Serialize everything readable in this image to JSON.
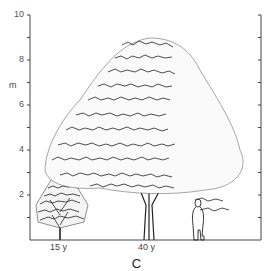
{
  "figure": {
    "y_axis": {
      "unit_label": "m",
      "ticks": [
        {
          "label": "2",
          "value": 2
        },
        {
          "label": "4",
          "value": 4
        },
        {
          "label": "6",
          "value": 6
        },
        {
          "label": "8",
          "value": 8
        },
        {
          "label": "10",
          "value": 10
        }
      ],
      "min": 0,
      "max": 10,
      "minor_step": 1
    },
    "x_labels": [
      {
        "label": "15 y"
      },
      {
        "label": "40 y"
      }
    ],
    "subjects": [
      {
        "name": "tree-15-years",
        "height_m": 3.3
      },
      {
        "name": "tree-40-years",
        "height_m": 9.1
      },
      {
        "name": "human-figure",
        "height_m": 1.8
      }
    ],
    "caption": "C"
  },
  "colors": {
    "line": "#222222",
    "axis": "#444444",
    "background": "#ffffff"
  }
}
